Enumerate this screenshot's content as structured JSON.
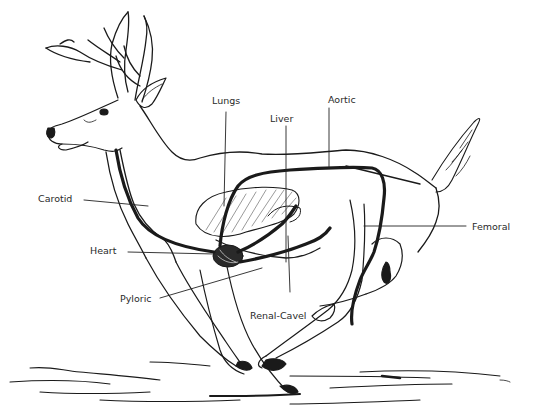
{
  "diagram": {
    "labels": {
      "lungs": "Lungs",
      "liver": "Liver",
      "aortic": "Aortic",
      "carotid": "Carotid",
      "heart": "Heart",
      "pyloric": "Pyloric",
      "renal_cavel": "Renal-Cavel",
      "femoral": "Femoral"
    },
    "colors": {
      "ink": "#1a1a1a",
      "hatch": "#555555",
      "background": "#ffffff"
    }
  }
}
